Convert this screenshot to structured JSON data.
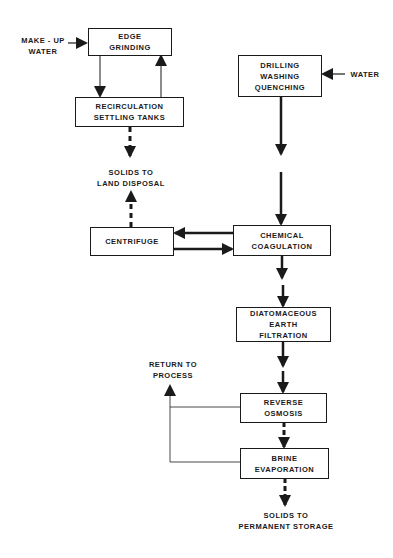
{
  "diagram": {
    "type": "process-flow",
    "nodes": {
      "edge_grinding": {
        "lines": [
          "EDGE",
          "GRINDING"
        ]
      },
      "recirculation": {
        "lines": [
          "RECIRCULATION",
          "SETTLING  TANKS"
        ]
      },
      "drilling": {
        "lines": [
          "DRILLING",
          "WASHING",
          "QUENCHING"
        ]
      },
      "centrifuge": {
        "lines": [
          "CENTRIFUGE"
        ]
      },
      "chemical": {
        "lines": [
          "CHEMICAL",
          "COAGULATION"
        ]
      },
      "diatomaceous": {
        "lines": [
          "DIATOMACEOUS",
          "EARTH",
          "FILTRATION"
        ]
      },
      "reverse_osmosis": {
        "lines": [
          "REVERSE",
          "OSMOSIS"
        ]
      },
      "brine": {
        "lines": [
          "BRINE",
          "EVAPORATION"
        ]
      }
    },
    "labels": {
      "makeup_water": [
        "MAKE - UP",
        "WATER"
      ],
      "water": [
        "WATER"
      ],
      "solids_land": [
        "SOLIDS  TO",
        "LAND DISPOSAL"
      ],
      "return_process": [
        "RETURN  TO",
        "PROCESS"
      ],
      "solids_storage": [
        "SOLIDS   TO",
        "PERMANENT  STORAGE"
      ]
    },
    "edges": [
      {
        "from": "MAKE-UP WATER",
        "to": "EDGE GRINDING",
        "style": "solid"
      },
      {
        "from": "EDGE GRINDING",
        "to": "RECIRCULATION SETTLING TANKS",
        "style": "thin"
      },
      {
        "from": "RECIRCULATION SETTLING TANKS",
        "to": "EDGE GRINDING",
        "style": "thin"
      },
      {
        "from": "RECIRCULATION SETTLING TANKS",
        "to": "SOLIDS TO LAND DISPOSAL",
        "style": "dashed"
      },
      {
        "from": "WATER",
        "to": "DRILLING WASHING QUENCHING",
        "style": "solid"
      },
      {
        "from": "DRILLING WASHING QUENCHING",
        "to": "CHEMICAL COAGULATION",
        "style": "thick"
      },
      {
        "from": "CHEMICAL COAGULATION",
        "to": "CENTRIFUGE",
        "style": "thick"
      },
      {
        "from": "CENTRIFUGE",
        "to": "CHEMICAL COAGULATION",
        "style": "thick"
      },
      {
        "from": "CENTRIFUGE",
        "to": "SOLIDS TO LAND DISPOSAL",
        "style": "dashed"
      },
      {
        "from": "CHEMICAL COAGULATION",
        "to": "DIATOMACEOUS EARTH FILTRATION",
        "style": "thick"
      },
      {
        "from": "DIATOMACEOUS EARTH FILTRATION",
        "to": "REVERSE OSMOSIS",
        "style": "thick"
      },
      {
        "from": "REVERSE OSMOSIS",
        "to": "RETURN TO PROCESS",
        "style": "thin"
      },
      {
        "from": "BRINE EVAPORATION",
        "to": "RETURN TO PROCESS",
        "style": "thin"
      },
      {
        "from": "REVERSE OSMOSIS",
        "to": "BRINE EVAPORATION",
        "style": "dashed"
      },
      {
        "from": "BRINE EVAPORATION",
        "to": "SOLIDS TO PERMANENT STORAGE",
        "style": "dashed"
      }
    ]
  }
}
